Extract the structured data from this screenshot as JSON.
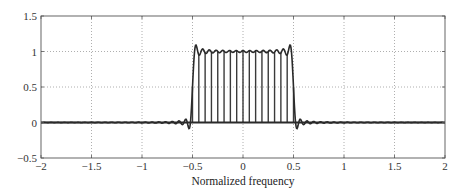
{
  "chart_data": {
    "type": "line",
    "title": "",
    "xlabel": "Normalized frequency",
    "ylabel": "",
    "xlim": [
      -2,
      2
    ],
    "ylim": [
      -0.5,
      1.5
    ],
    "xticks": [
      -2,
      -1.5,
      -1,
      -0.5,
      0,
      0.5,
      1,
      1.5,
      2
    ],
    "xtick_labels": [
      "−2",
      "−1.5",
      "−1",
      "−0.5",
      "0",
      "0.5",
      "1",
      "1.5",
      "2"
    ],
    "yticks": [
      -0.5,
      0,
      0.5,
      1,
      1.5
    ],
    "ytick_labels": [
      "−0.5",
      "0",
      "0.5",
      "1",
      "1.5"
    ],
    "grid": "dotted",
    "legend": null,
    "series": [
      {
        "name": "continuous frequency response (ideal lowpass, truncated, Gibbs ripple)",
        "kind": "line",
        "cutoff": 0.5,
        "passband_level": 1.0,
        "overshoot_peak": 1.13,
        "overshoot_x": [
          -0.47,
          0.47
        ],
        "first_sidelobe_min": -0.12,
        "sidelobe_x": [
          -0.56,
          0.56
        ],
        "num_terms": 12
      },
      {
        "name": "sampled response (stems)",
        "kind": "stem",
        "spacing": 0.0625,
        "x_range": [
          -0.5,
          0.5
        ],
        "value": 1.0
      },
      {
        "name": "zero baseline",
        "kind": "line",
        "value": 0.0
      }
    ],
    "annotations": []
  },
  "colors": {
    "line": "#2a2a2a",
    "stem": "#3a3a3a",
    "grid": "#9a9a9a",
    "frame": "#555555",
    "background": "#ffffff"
  },
  "plot_area": {
    "left": 41,
    "top": 16,
    "right": 445,
    "bottom": 158
  }
}
